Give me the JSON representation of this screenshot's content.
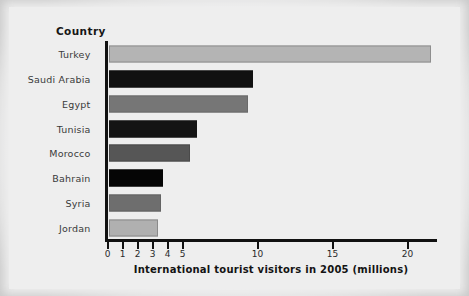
{
  "chart_data": {
    "type": "bar",
    "orientation": "horizontal",
    "title": "",
    "category_header": "Country",
    "categories": [
      "Turkey",
      "Saudi Arabia",
      "Egypt",
      "Tunisia",
      "Morocco",
      "Bahrain",
      "Syria",
      "Jordan"
    ],
    "values": [
      21.5,
      9.6,
      9.3,
      5.9,
      5.4,
      3.6,
      3.5,
      3.3
    ],
    "bar_colors": [
      "#b4b4b4",
      "#111111",
      "#767676",
      "#141414",
      "#565656",
      "#050505",
      "#6e6e6e",
      "#b0b0b0"
    ],
    "bar_border_colors": [
      "#8e8e8e",
      "#111111",
      "#6a6a6a",
      "#141414",
      "#4a4a4a",
      "#050505",
      "#636363",
      "#8a8a8a"
    ],
    "xlabel": "International tourist visitors in 2005 (millions)",
    "ylabel": "Country",
    "xlim": [
      0,
      22
    ],
    "xticks": [
      0,
      1,
      2,
      3,
      4,
      5,
      10,
      15,
      20
    ],
    "xtick_labels": [
      "0",
      "1",
      "2",
      "3",
      "4",
      "5",
      "10",
      "15",
      "20"
    ],
    "grid": false,
    "legend": null,
    "units": "millions",
    "year": 2005
  }
}
